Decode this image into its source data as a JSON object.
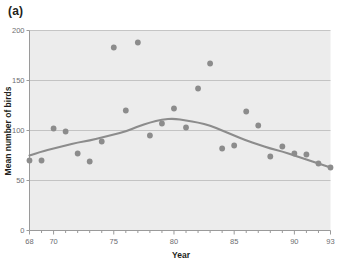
{
  "panel": {
    "label": "(a)"
  },
  "chart_data": {
    "type": "scatter",
    "title": "",
    "subtitle": "",
    "xlabel": "Year",
    "ylabel": "Mean number of birds",
    "xlim": [
      68,
      93
    ],
    "ylim": [
      0,
      200
    ],
    "xticks": [
      68,
      69,
      70,
      71,
      72,
      73,
      74,
      75,
      76,
      77,
      78,
      79,
      80,
      81,
      82,
      83,
      84,
      85,
      86,
      87,
      88,
      89,
      90,
      91,
      92,
      93
    ],
    "xtick_labels": [
      "68",
      "",
      "70",
      "",
      "",
      "",
      "",
      "75",
      "",
      "",
      "",
      "",
      "80",
      "",
      "",
      "",
      "",
      "85",
      "",
      "",
      "",
      "",
      "90",
      "",
      "",
      "93"
    ],
    "yticks": [
      0,
      50,
      100,
      150,
      200
    ],
    "ytick_labels": [
      "0",
      "50",
      "100",
      "150",
      "200"
    ],
    "grid": "horizontal",
    "legend": "none",
    "plot_background": "#ececec",
    "point_color": "#8c8c8c",
    "line_color": "#8c8c8c",
    "axis_color": "#9a9a9a",
    "x": [
      68,
      69,
      70,
      71,
      72,
      73,
      74,
      75,
      76,
      77,
      78,
      79,
      80,
      81,
      82,
      83,
      84,
      85,
      86,
      87,
      88,
      89,
      90,
      91,
      92,
      93
    ],
    "values": [
      70,
      70,
      102,
      99,
      77,
      69,
      89,
      183,
      120,
      188,
      95,
      107,
      122,
      103,
      142,
      167,
      82,
      85,
      119,
      105,
      74,
      84,
      77,
      76,
      67,
      63
    ],
    "series": [
      {
        "name": "Mean number of birds",
        "type": "scatter",
        "values": [
          70,
          70,
          102,
          99,
          77,
          69,
          89,
          183,
          120,
          188,
          95,
          107,
          122,
          103,
          142,
          167,
          82,
          85,
          119,
          105,
          74,
          84,
          77,
          76,
          67,
          63
        ]
      },
      {
        "name": "Smoothed trend",
        "type": "line",
        "values": [
          75,
          79,
          82,
          85,
          88,
          90,
          93,
          96,
          99,
          104,
          108,
          111,
          112,
          110,
          108,
          105,
          100,
          95,
          90,
          86,
          82,
          79,
          75,
          71,
          67,
          63
        ]
      }
    ]
  }
}
